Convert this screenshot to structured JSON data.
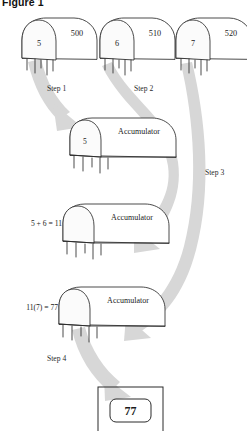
{
  "figure": {
    "title": "Figure 1",
    "caption_visible": true
  },
  "memory_cells": [
    {
      "id": "cell-500",
      "address": "500",
      "value": "5"
    },
    {
      "id": "cell-510",
      "address": "510",
      "value": "6"
    },
    {
      "id": "cell-520",
      "address": "520",
      "value": "7"
    }
  ],
  "accumulators": [
    {
      "id": "accumulator-1",
      "label": "Accumulator",
      "value": "5",
      "equation": ""
    },
    {
      "id": "accumulator-2",
      "label": "Accumulator",
      "value": "11",
      "equation": "5 + 6 = 11"
    },
    {
      "id": "accumulator-3",
      "label": "Accumulator",
      "value": "77",
      "equation": "11(7) = 77"
    }
  ],
  "steps": [
    {
      "id": "step-1",
      "label": "Step 1"
    },
    {
      "id": "step-2",
      "label": "Step 2"
    },
    {
      "id": "step-3",
      "label": "Step 3"
    },
    {
      "id": "step-4",
      "label": "Step 4"
    }
  ],
  "result": {
    "id": "result-box",
    "value": "77"
  },
  "colors": {
    "arrow_band": "#d7d7d7",
    "outline": "#2a2a2a",
    "text": "#1a1a1a",
    "background": "#ffffff"
  }
}
